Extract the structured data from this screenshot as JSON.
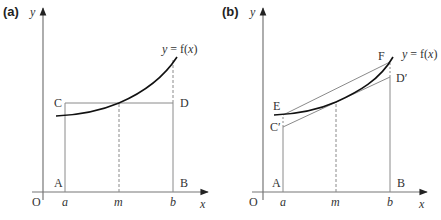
{
  "panels": [
    {
      "label": "(a)",
      "y_axis_label": "y",
      "x_axis_label": "x",
      "origin_label": "O",
      "curve_label_y": "y",
      "curve_label_eq": " = f(",
      "curve_label_x": "x",
      "curve_label_close": ")",
      "points": {
        "A": "A",
        "B": "B",
        "C": "C",
        "D": "D"
      },
      "ticks": {
        "a": "a",
        "m": "m",
        "b": "b"
      }
    },
    {
      "label": "(b)",
      "y_axis_label": "y",
      "x_axis_label": "x",
      "origin_label": "O",
      "curve_label_y": "y",
      "curve_label_eq": " = f(",
      "curve_label_x": "x",
      "curve_label_close": ")",
      "points": {
        "A": "A",
        "B": "B",
        "C": "C′",
        "D": "D′",
        "E": "E",
        "F": "F"
      },
      "ticks": {
        "a": "a",
        "m": "m",
        "b": "b"
      }
    }
  ],
  "colors": {
    "curve": "#111111",
    "lines": "#8a8a8a",
    "axes": "#555555",
    "text": "#333333"
  }
}
